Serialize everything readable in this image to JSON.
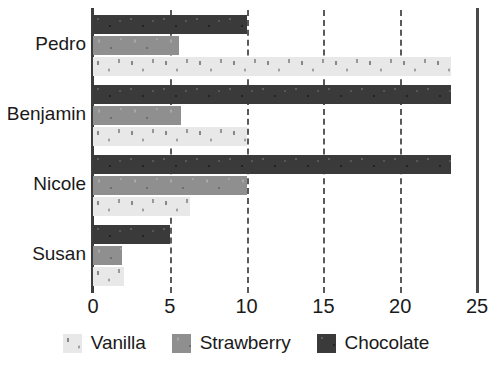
{
  "chart_data": {
    "type": "bar",
    "orientation": "horizontal",
    "title": "",
    "xlabel": "",
    "ylabel": "",
    "categories": [
      "Pedro",
      "Benjamin",
      "Nicole",
      "Susan"
    ],
    "series": [
      {
        "name": "Vanilla",
        "color": "#e8e8e8",
        "values": [
          23.3,
          10.0,
          6.3,
          2.0
        ]
      },
      {
        "name": "Strawberry",
        "color": "#8f8f8f",
        "values": [
          5.6,
          5.7,
          10.0,
          1.9
        ]
      },
      {
        "name": "Chocolate",
        "color": "#3a3a3a",
        "values": [
          10.0,
          23.3,
          23.3,
          5.0
        ]
      }
    ],
    "series_order_top_to_bottom": [
      "Chocolate",
      "Strawberry",
      "Vanilla"
    ],
    "xlim": [
      0,
      25
    ],
    "xticks": [
      0,
      5,
      10,
      15,
      20,
      25
    ],
    "xtick_labels": [
      "0",
      "5",
      "10",
      "15",
      "20",
      "25"
    ],
    "grid": true,
    "grid_style": "dashed",
    "legend_position": "bottom"
  },
  "legend": {
    "items": [
      {
        "label": "Vanilla",
        "swatch": "vanilla-swatch"
      },
      {
        "label": "Strawberry",
        "swatch": "strawberry-swatch"
      },
      {
        "label": "Chocolate",
        "swatch": "chocolate-swatch"
      }
    ]
  }
}
